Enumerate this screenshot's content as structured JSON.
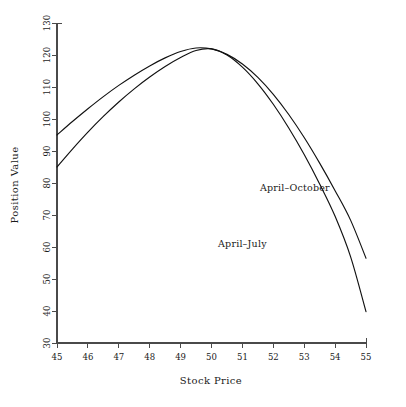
{
  "chart_data": {
    "type": "line",
    "title": "",
    "xlabel": "Stock Price",
    "ylabel": "Position Value",
    "xlim": [
      45,
      55
    ],
    "ylim": [
      30,
      130
    ],
    "xticks": [
      "45",
      "46",
      "47",
      "48",
      "49",
      "50",
      "51",
      "52",
      "53",
      "54",
      "55"
    ],
    "yticks": [
      "30",
      "40",
      "50",
      "60",
      "70",
      "80",
      "90",
      "100",
      "110",
      "120",
      "130"
    ],
    "grid": false,
    "legend": "inline-annotations",
    "series": [
      {
        "name": "April-October",
        "label": "April–October",
        "label_x": 52.7,
        "label_y": 77.5,
        "color": "#111111",
        "x": [
          45,
          45.5,
          46,
          46.5,
          47,
          47.5,
          48,
          48.5,
          49,
          49.5,
          50,
          50.5,
          51,
          51.5,
          52,
          52.5,
          53,
          53.5,
          54,
          54.5,
          55
        ],
        "values": [
          95.0,
          99.2,
          103.2,
          107.0,
          110.5,
          113.7,
          116.6,
          119.1,
          121.1,
          122.2,
          121.9,
          120.2,
          117.2,
          113.0,
          107.7,
          101.4,
          94.2,
          86.2,
          77.6,
          68.4,
          56.5
        ]
      },
      {
        "name": "April-July",
        "label": "April–July",
        "label_x": 51.0,
        "label_y": 60.0,
        "color": "#111111",
        "x": [
          45,
          45.5,
          46,
          46.5,
          47,
          47.5,
          48,
          48.5,
          49,
          49.5,
          50,
          50.5,
          51,
          51.5,
          52,
          52.5,
          53,
          53.5,
          54,
          54.5,
          55
        ],
        "values": [
          85.0,
          90.6,
          95.9,
          100.8,
          105.3,
          109.4,
          113.1,
          116.4,
          119.2,
          121.4,
          121.9,
          120.0,
          116.2,
          111.0,
          104.6,
          97.2,
          88.9,
          79.7,
          69.6,
          57.0,
          39.8
        ]
      }
    ]
  }
}
